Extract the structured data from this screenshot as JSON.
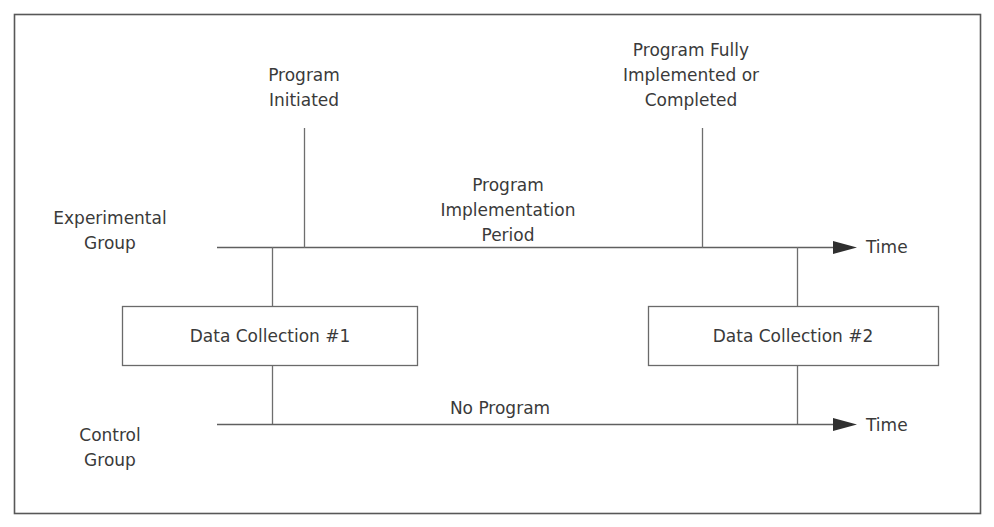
{
  "diagram": {
    "frame": {
      "stroke": "#585858"
    },
    "text_color": "#3a3a3a",
    "line_color": "#6e6e6e",
    "arrow_color": "#2f2f2f",
    "group_labels": {
      "experimental": {
        "line1": "Experimental",
        "line2": "Group"
      },
      "control": {
        "line1": "Control",
        "line2": "Group"
      }
    },
    "event_labels": {
      "program_initiated": {
        "line1": "Program",
        "line2": "Initiated"
      },
      "program_completed": {
        "line1": "Program Fully",
        "line2": "Implemented or",
        "line3": "Completed"
      }
    },
    "period_label": {
      "line1": "Program",
      "line2": "Implementation",
      "line3": "Period"
    },
    "control_period_label": "No Program",
    "boxes": [
      {
        "label": "Data Collection #1"
      },
      {
        "label": "Data Collection #2"
      }
    ],
    "axis_labels": {
      "experimental_time": "Time",
      "control_time": "Time"
    }
  }
}
